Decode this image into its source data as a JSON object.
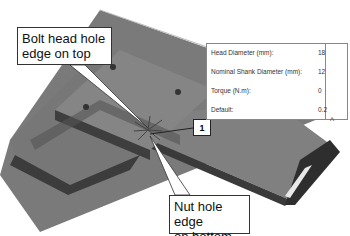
{
  "callouts": {
    "top": {
      "line1": "Bolt head hole",
      "line2": "edge on top"
    },
    "bottom": {
      "line1": "Nut hole edge",
      "line2": "on bottom"
    },
    "marker": "1"
  },
  "properties": {
    "rows": [
      {
        "label": "Head Diameter (mm):",
        "value": "18"
      },
      {
        "label": "Nominal Shank Diameter (mm):",
        "value": "12"
      },
      {
        "label": "Torque (N.m):",
        "value": "0"
      },
      {
        "label": "Default:",
        "value": "0.2"
      }
    ]
  },
  "icons": {
    "collapse": "^"
  },
  "colors": {
    "plate_face": "#7a7a7a",
    "plate_edge": "#3e3e3e",
    "background": "#ffffff"
  }
}
